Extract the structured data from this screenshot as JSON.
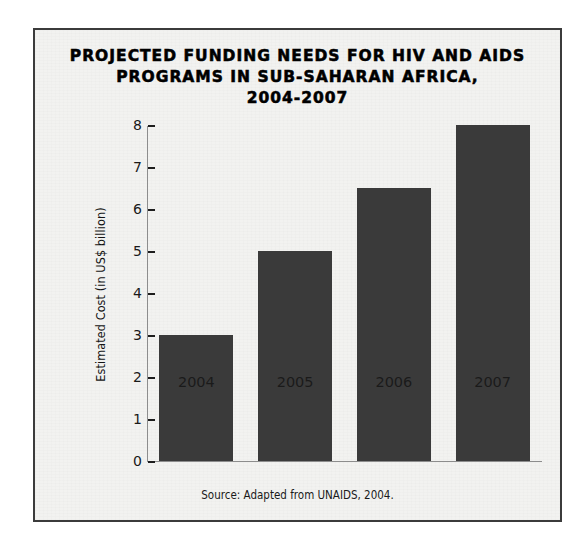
{
  "figure": {
    "title_lines": [
      "PROJECTED FUNDING NEEDS FOR HIV AND AIDS",
      "PROGRAMS IN SUB-SAHARAN AFRICA,",
      "2004-2007"
    ],
    "source_note": "Source: Adapted from UNAIDS, 2004.",
    "bar_color": "#3a3a3a",
    "background_color": "#f2f2f0",
    "border_color": "#3b3b3b",
    "text_color": "#1a1a1a"
  },
  "chart_data": {
    "type": "bar",
    "title": "PROJECTED FUNDING NEEDS FOR HIV AND AIDS PROGRAMS IN SUB-SAHARAN AFRICA, 2004-2007",
    "categories": [
      "2004",
      "2005",
      "2006",
      "2007"
    ],
    "values": [
      3.0,
      5.0,
      6.5,
      8.0
    ],
    "xlabel": "",
    "ylabel": "Estimated Cost (in US$ billion)",
    "ylim": [
      0,
      8
    ],
    "yticks": [
      0,
      1,
      2,
      3,
      4,
      5,
      6,
      7,
      8
    ],
    "ytick_labels": [
      "0",
      "1",
      "2",
      "3",
      "4",
      "5",
      "6",
      "7",
      "8"
    ],
    "grid": false,
    "legend": false,
    "legend_position": "none",
    "annotations": [
      "Source: Adapted from UNAIDS, 2004."
    ]
  }
}
